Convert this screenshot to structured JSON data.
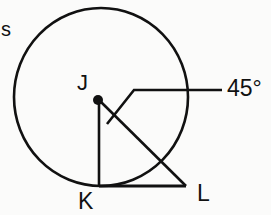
{
  "diagram": {
    "type": "geometry",
    "labels": {
      "corner": "s",
      "center": "J",
      "tangent_point": "K",
      "external_point": "L",
      "angle": "45°"
    },
    "colors": {
      "stroke": "#111111",
      "background": "#fbfbfa"
    }
  }
}
